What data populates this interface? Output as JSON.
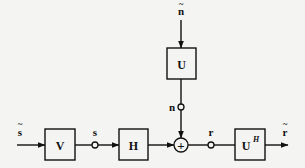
{
  "diagram": {
    "type": "block-diagram",
    "signals": {
      "input": {
        "symbol": "s",
        "accent": "~",
        "label": "s̃"
      },
      "s": {
        "label": "s"
      },
      "noise_in": {
        "symbol": "n",
        "accent": "~",
        "label": "ñ"
      },
      "n": {
        "label": "n"
      },
      "r": {
        "label": "r"
      },
      "output": {
        "symbol": "r",
        "accent": "~",
        "label": "r̃"
      }
    },
    "blocks": {
      "V": {
        "label": "V"
      },
      "H": {
        "label": "H"
      },
      "U": {
        "label": "U"
      },
      "UH": {
        "base": "U",
        "sup": "H"
      }
    },
    "summing_junction": {
      "symbol": "+"
    },
    "edges": [
      [
        "s̃",
        "V"
      ],
      [
        "V",
        "s"
      ],
      [
        "s",
        "H"
      ],
      [
        "H",
        "+"
      ],
      [
        "ñ",
        "U"
      ],
      [
        "U",
        "n"
      ],
      [
        "n",
        "+"
      ],
      [
        "+",
        "r"
      ],
      [
        "r",
        "U^H"
      ],
      [
        "U^H",
        "r̃"
      ]
    ]
  }
}
